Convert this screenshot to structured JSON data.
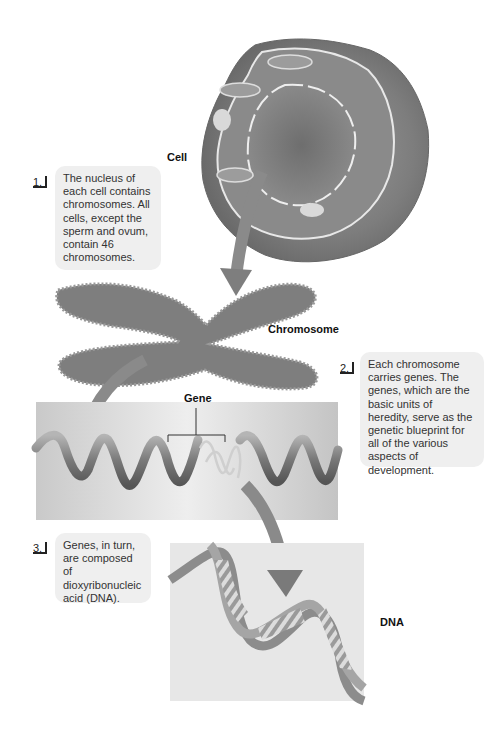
{
  "labels": {
    "cell": "Cell",
    "chromosome": "Chromosome",
    "gene": "Gene",
    "dna": "DNA"
  },
  "steps": [
    {
      "number": "1.",
      "text": "The nucleus of each cell contains chromosomes. All cells, except the sperm and ovum, contain 46 chromosomes."
    },
    {
      "number": "2.",
      "text": "Each chromosome carries genes. The genes, which are the basic units of heredity, serve as the genetic blueprint for all of the various aspects of development."
    },
    {
      "number": "3.",
      "text": "Genes, in turn, are composed of dioxyribonucleic acid (DNA)."
    }
  ],
  "colors": {
    "background": "#ffffff",
    "callout_box": "#efefef",
    "arrow": "#8a8a8a",
    "panel": "#dcdcdc"
  }
}
